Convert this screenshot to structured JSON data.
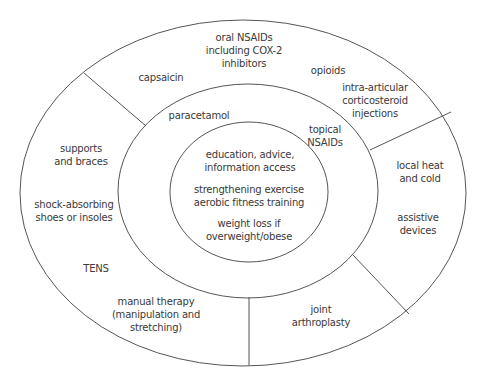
{
  "diagram": {
    "type": "concentric ellipses",
    "stroke_color": "#555555",
    "rings": {
      "core": {
        "items": [
          "education, advice,\ninformation access",
          "strengthening exercise\naerobic fitness training",
          "weight loss if\noverweight/obese"
        ]
      },
      "middle": {
        "items": [
          "paracetamol",
          "topical\nNSAIDs"
        ]
      },
      "outer": {
        "segments": {
          "top": [
            "capsaicin",
            "oral NSAIDs\nincluding COX-2\ninhibitors",
            "opioids",
            "intra-articular\ncorticosteroid\ninjections"
          ],
          "left": [
            "supports\nand braces",
            "shock-absorbing\nshoes or insoles",
            "TENS",
            "manual therapy\n(manipulation and\nstretching)"
          ],
          "right": [
            "local heat\nand cold",
            "assistive\ndevices"
          ],
          "bottom": [
            "joint\narthroplasty"
          ]
        }
      }
    }
  }
}
